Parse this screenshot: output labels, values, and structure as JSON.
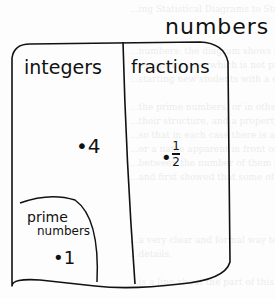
{
  "diagram": {
    "title": "numbers",
    "regions": [
      {
        "label": "integers",
        "member": "4"
      },
      {
        "label": "fractions",
        "member_numerator": "1",
        "member_denominator": "2"
      },
      {
        "label_line1": "prime",
        "label_line2": "numbers",
        "member": "1",
        "parent": "integers"
      }
    ],
    "dot": "•",
    "stroke_color": "#111111"
  },
  "background_bleed": [
    "...ing Statistical Diagrams to Students",
    "...numbers: the diagram shows the numbers",
    "...except for one, which is not prime",
    "...starting new students with a definite idea",
    "...the prime numbers, or in other words",
    "...their structure, and a property of numbers",
    "...so that in each case there is a name",
    "...or a name apparent in front of the picture",
    "...between the number of them and the other",
    "...and first showed that some of the numbers",
    "...a very clear and formal way to represent",
    "...details.",
    "...is a line about the part of this can be in"
  ]
}
